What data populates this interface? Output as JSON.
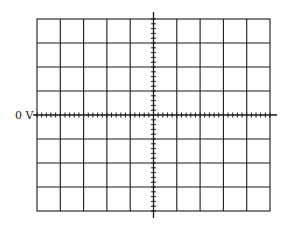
{
  "graticule": {
    "description": "Oscilloscope screen graticule",
    "horizontal_divisions": 10,
    "vertical_divisions": 8,
    "minor_ticks_per_division": 5,
    "line_color": "#1a1a1a",
    "background_color": "#ffffff"
  },
  "labels": {
    "zero_reference": "0 V"
  }
}
